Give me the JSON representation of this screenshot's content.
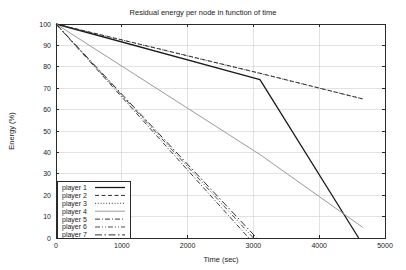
{
  "chart_data": {
    "type": "line",
    "title": "Residual energy per node in function of time",
    "xlabel": "Time (sec)",
    "ylabel": "Energy (%)",
    "xlim": [
      0,
      5000
    ],
    "ylim": [
      0,
      100
    ],
    "xticks": [
      0,
      1000,
      2000,
      3000,
      4000,
      5000
    ],
    "yticks": [
      0,
      10,
      20,
      30,
      40,
      50,
      60,
      70,
      80,
      90,
      100
    ],
    "grid": true,
    "legend_position": "lower left",
    "series": [
      {
        "name": "player 1",
        "style": "solid",
        "color": "#1a1a1a",
        "width": 1.3,
        "x": [
          0,
          3100,
          4600
        ],
        "y": [
          100,
          74,
          0
        ]
      },
      {
        "name": "player 2",
        "style": "dashed",
        "color": "#2e2e2e",
        "width": 1.0,
        "x": [
          0,
          3100,
          4660
        ],
        "y": [
          100,
          77,
          65
        ]
      },
      {
        "name": "player 3",
        "style": "dotted",
        "color": "#3a3a3a",
        "width": 1.0,
        "x": [
          0,
          3150,
          4660
        ],
        "y": [
          100,
          76.5,
          65
        ]
      },
      {
        "name": "player 4",
        "style": "solid-thin",
        "color": "#9a9a9a",
        "width": 1.0,
        "x": [
          0,
          3100,
          4660
        ],
        "y": [
          100,
          39,
          5
        ]
      },
      {
        "name": "player 5",
        "style": "dash-dot",
        "color": "#3a3a3a",
        "width": 1.0,
        "x": [
          0,
          2930
        ],
        "y": [
          100,
          0
        ]
      },
      {
        "name": "player 6",
        "style": "dash-dot-dot",
        "color": "#4a4a4a",
        "width": 1.0,
        "x": [
          0,
          3000
        ],
        "y": [
          100,
          0
        ]
      },
      {
        "name": "player 7",
        "style": "long-dash-dot",
        "color": "#2e2e2e",
        "width": 1.0,
        "x": [
          0,
          3050
        ],
        "y": [
          100,
          0
        ]
      }
    ]
  },
  "legend": {
    "items": [
      {
        "label": "player 1"
      },
      {
        "label": "player 2"
      },
      {
        "label": "player 3"
      },
      {
        "label": "player 4"
      },
      {
        "label": "player 5"
      },
      {
        "label": "player 6"
      },
      {
        "label": "player 7"
      }
    ]
  },
  "colors": {
    "background": "#ffffff",
    "axis": "#2a2a2a",
    "grid": "#cfcfcf",
    "text": "#1a1a1a"
  }
}
